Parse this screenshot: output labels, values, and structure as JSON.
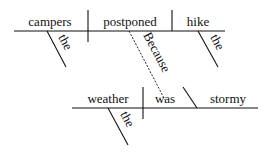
{
  "diagram": {
    "type": "sentence-diagram",
    "main_clause": {
      "subject": "campers",
      "subject_modifier": "the",
      "verb": "postponed",
      "object": "hike",
      "object_modifier": "the"
    },
    "connector": "Because",
    "subordinate_clause": {
      "subject": "weather",
      "subject_modifier": "the",
      "verb": "was",
      "complement": "stormy"
    }
  }
}
